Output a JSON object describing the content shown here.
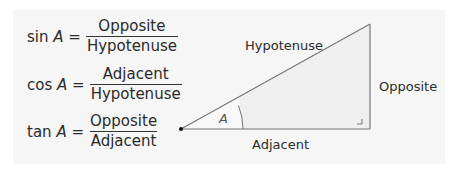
{
  "formulas": [
    {
      "func": "sin",
      "angle": "A",
      "equals": "=",
      "numerator": "Opposite",
      "denominator": "Hypotenuse"
    },
    {
      "func": "cos",
      "angle": "A",
      "equals": "=",
      "numerator": "Adjacent",
      "denominator": "Hypotenuse"
    },
    {
      "func": "tan",
      "angle": "A",
      "equals": "=",
      "numerator": "Opposite",
      "denominator": "Adjacent"
    }
  ],
  "triangle": {
    "hypotenuse_label": "Hypotenuse",
    "opposite_label": "Opposite",
    "adjacent_label": "Adjacent",
    "angle_label": "A",
    "colors": {
      "line": "#777777",
      "fill": "#eeeeee",
      "panel": "#f6f6f6"
    }
  }
}
